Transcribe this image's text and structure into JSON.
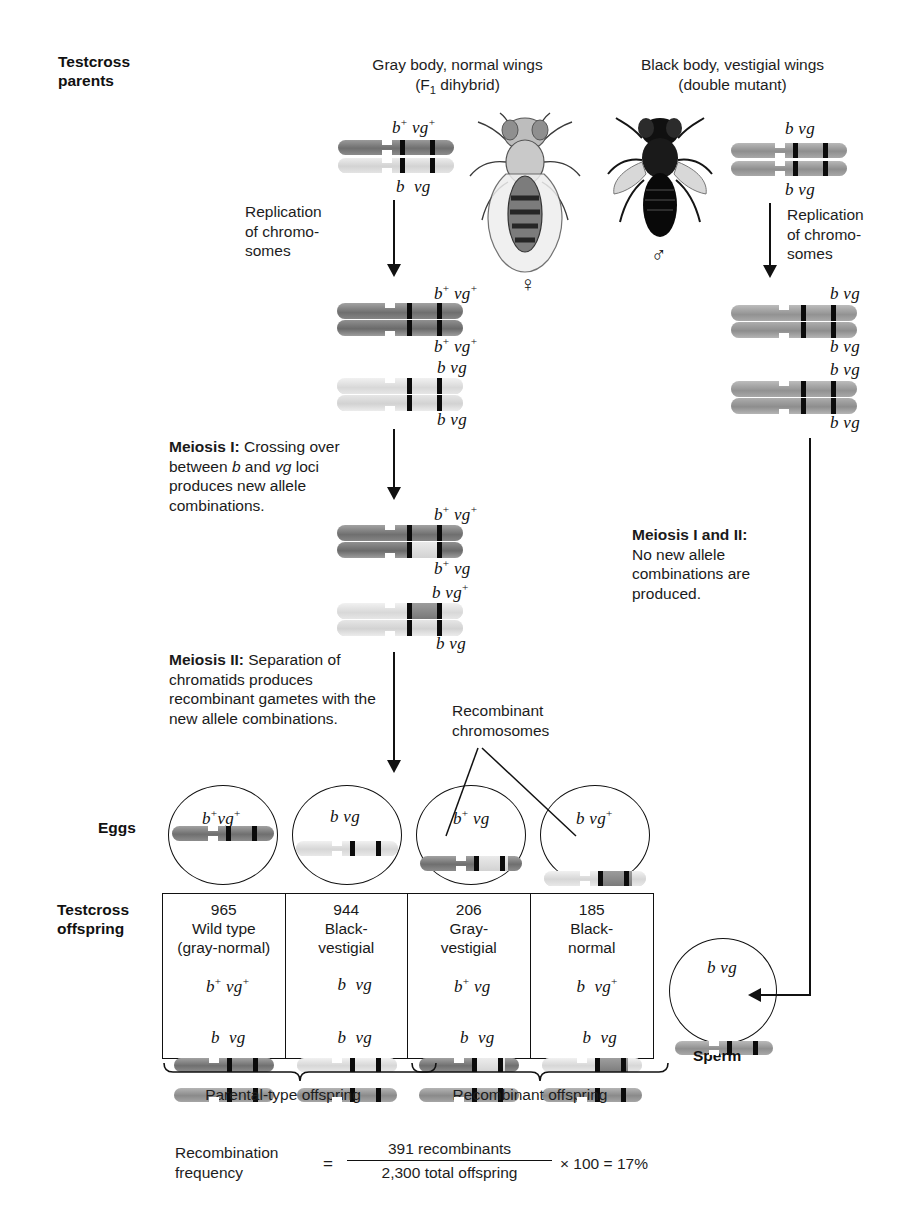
{
  "figure": {
    "row_labels": {
      "testcross_parents": "Testcross\nparents",
      "eggs": "Eggs",
      "testcross_offspring": "Testcross\noffspring",
      "sperm": "Sperm"
    },
    "parents": {
      "female": {
        "title_line1": "Gray body, normal wings",
        "title_line2_pre": "(F",
        "title_line2_sub": "1",
        "title_line2_post": " dihybrid)",
        "sex_symbol": "♀",
        "chromosome_top_label": "b⁺ vg⁺",
        "chromosome_bottom_label": "b vg"
      },
      "male": {
        "title_line1": "Black body, vestigial wings",
        "title_line2": "(double mutant)",
        "sex_symbol": "♂",
        "chromosome_top_label": "b vg",
        "chromosome_bottom_label": "b vg"
      }
    },
    "steps": {
      "replication_left": "Replication\nof chromo-\nsomes",
      "replication_right": "Replication\nof chromo-\nsomes",
      "meiosis_1_bold": "Meiosis I:",
      "meiosis_1_text": " Crossing over between b and vg loci produces new allele combinations.",
      "meiosis_2_bold": "Meiosis II:",
      "meiosis_2_text": " Separation of chromatids produces recombinant gametes with the new allele combinations.",
      "meiosis_right_bold": "Meiosis I and II:",
      "meiosis_right_text": "No new allele combinations are produced."
    },
    "callout": {
      "recombinant_line1": "Recombinant",
      "recombinant_line2": "chromosomes"
    },
    "replicated_left": [
      {
        "top": "b⁺ vg⁺",
        "bottom": "b⁺ vg⁺",
        "shade": "dark"
      },
      {
        "top": "b vg",
        "bottom": "b vg",
        "shade": "light"
      }
    ],
    "crossover_left": [
      {
        "top": "b⁺ vg⁺",
        "bottom": "b⁺ vg",
        "shade": "dark"
      },
      {
        "top": "b vg⁺",
        "bottom": "b vg",
        "shade": "light"
      }
    ],
    "replicated_right": [
      {
        "top": "b vg",
        "bottom": "b vg",
        "shade": "mid"
      },
      {
        "top": "b vg",
        "bottom": "b vg",
        "shade": "mid"
      }
    ],
    "eggs": [
      {
        "label": "b⁺ vg⁺",
        "shade": "dark",
        "recombinant": false
      },
      {
        "label": "b vg",
        "shade": "light",
        "recombinant": false
      },
      {
        "label": "b⁺ vg",
        "shade": "dark",
        "recombinant": true
      },
      {
        "label": "b vg⁺",
        "shade": "light",
        "recombinant": true
      }
    ],
    "sperm": {
      "label": "b vg",
      "shade": "mid"
    },
    "offspring": [
      {
        "count": "965",
        "name_line1": "Wild type",
        "name_line2": "(gray-normal)",
        "top_label": "b⁺ vg⁺",
        "bottom_label": "b vg",
        "top_shade": "dark",
        "bottom_shade": "mid"
      },
      {
        "count": "944",
        "name_line1": "Black-",
        "name_line2": "vestigial",
        "top_label": "b vg",
        "bottom_label": "b vg",
        "top_shade": "light",
        "bottom_shade": "mid"
      },
      {
        "count": "206",
        "name_line1": "Gray-",
        "name_line2": "vestigial",
        "top_label": "b⁺ vg",
        "bottom_label": "b vg",
        "top_shade": "dark",
        "bottom_shade": "mid"
      },
      {
        "count": "185",
        "name_line1": "Black-",
        "name_line2": "normal",
        "top_label": "b vg⁺",
        "bottom_label": "b vg",
        "top_shade": "light",
        "bottom_shade": "mid"
      }
    ],
    "braces": {
      "parental": "Parental-type offspring",
      "recombinant": "Recombinant offspring"
    },
    "formula": {
      "label_line1": "Recombination",
      "label_line2": "frequency",
      "equals": "=",
      "numerator": "391 recombinants",
      "denominator": "2,300 total offspring",
      "times": "× 100 =",
      "result": "17%"
    },
    "colors": {
      "ink": "#1a1a1a",
      "chrom_dark": "#7d7d7d",
      "chrom_mid": "#9b9b9b",
      "chrom_light": "#dcdcdc",
      "band": "#0b0b0b",
      "background": "#ffffff"
    }
  }
}
